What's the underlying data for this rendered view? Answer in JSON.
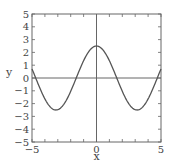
{
  "chart_data": {
    "type": "line",
    "title": "",
    "xlabel": "x",
    "ylabel": "y",
    "xlim": [
      -5,
      5
    ],
    "ylim": [
      -5,
      5
    ],
    "grid": false,
    "legend": null,
    "function": "2.5*cos(x)",
    "x_ticks": [
      -5,
      -4,
      -3,
      -2,
      -1,
      0,
      1,
      2,
      3,
      4,
      5
    ],
    "x_tick_labels": [
      "-5",
      "0",
      "5"
    ],
    "y_ticks": [
      -5,
      -4,
      -3,
      -2,
      -1,
      0,
      1,
      2,
      3,
      4,
      5
    ],
    "y_tick_labels": [
      "-5",
      "-4",
      "-3",
      "-2",
      "-1",
      "0",
      "1",
      "2",
      "3",
      "4",
      "5"
    ],
    "reference_lines": [
      {
        "axis": "x",
        "value": 0
      },
      {
        "axis": "y",
        "value": 0
      }
    ],
    "series": [
      {
        "name": "y = 2.5 cos(x)",
        "color": "#555555",
        "x": [
          -5,
          -4.5,
          -4,
          -3.5,
          -3,
          -2.5,
          -2,
          -1.5,
          -1,
          -0.5,
          0,
          0.5,
          1,
          1.5,
          2,
          2.5,
          3,
          3.5,
          4,
          4.5,
          5
        ],
        "y": [
          0.71,
          -0.53,
          -1.63,
          -2.34,
          -2.47,
          -2.0,
          -1.04,
          0.18,
          1.35,
          2.19,
          2.5,
          2.19,
          1.35,
          0.18,
          -1.04,
          -2.0,
          -2.47,
          -2.34,
          -1.63,
          -0.53,
          0.71
        ]
      }
    ]
  },
  "colors": {
    "frame": "#666666",
    "curve": "#555555",
    "text": "#444444"
  }
}
